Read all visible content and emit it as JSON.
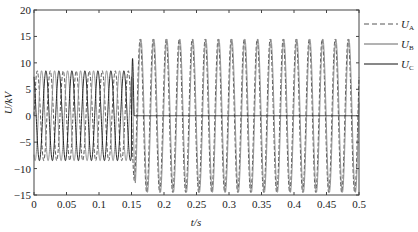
{
  "chart_data": {
    "type": "line",
    "title": "",
    "xlabel": "t/s",
    "ylabel": "U/kV",
    "xlim": [
      0,
      0.5
    ],
    "ylim": [
      -15,
      20
    ],
    "xticks": [
      0,
      0.05,
      0.1,
      0.15,
      0.2,
      0.25,
      0.3,
      0.35,
      0.4,
      0.45,
      0.5
    ],
    "xtick_labels": [
      "0",
      "0.05",
      "0.1",
      "0.15",
      "0.2",
      "0.25",
      "0.3",
      "0.35",
      "0.4",
      "0.45",
      "0.5"
    ],
    "yticks": [
      -15,
      -10,
      -5,
      0,
      5,
      10,
      15,
      20
    ],
    "ytick_labels": [
      "−15",
      "−10",
      "−5",
      "0",
      "5",
      "10",
      "15",
      "20"
    ],
    "grid": false,
    "legend_position": "right-outside-top",
    "frequency_hz": 50,
    "fault_time_s": 0.15,
    "series": [
      {
        "name": "U_A",
        "label_main": "U",
        "label_sub": "A",
        "style": "dashed",
        "color": "#555555",
        "pre_fault_amplitude_kv": 8.5,
        "post_fault_amplitude_kv": 14.5,
        "phase_deg_pre": 0,
        "phase_deg_post": 30
      },
      {
        "name": "U_B",
        "label_main": "U",
        "label_sub": "B",
        "style": "solid",
        "color": "#888888",
        "pre_fault_amplitude_kv": 8.5,
        "post_fault_amplitude_kv": 14.5,
        "phase_deg_pre": -120,
        "phase_deg_post": 10
      },
      {
        "name": "U_C",
        "label_main": "U",
        "label_sub": "C",
        "style": "solid",
        "color": "#111111",
        "pre_fault_amplitude_kv": 8.5,
        "post_fault_amplitude_kv": 0,
        "phase_deg_pre": 120,
        "transient_peak_kv": 15.5,
        "transient_peak_t_s": 0.152
      }
    ]
  }
}
